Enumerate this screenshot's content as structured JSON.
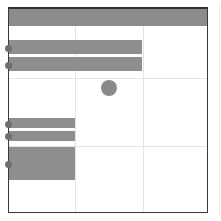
{
  "canvas": {
    "width": 221,
    "height": 221,
    "background": "#ffffff"
  },
  "colors": {
    "frame_border": "#3a3a3a",
    "header_fill": "#8c8c8c",
    "bar_fill": "#8e8e8e",
    "dot_fill": "#6e6e6e",
    "circle_fill": "#8a8a8a",
    "grid_line": "#e4e4e4"
  },
  "frame": {
    "header": {
      "label": ""
    },
    "grid": {
      "columns": 3,
      "rows": 3
    },
    "bars": [
      {
        "id": "bar-1",
        "top": 31,
        "height": 14,
        "width": 133
      },
      {
        "id": "bar-2",
        "top": 48,
        "height": 14,
        "width": 133
      },
      {
        "id": "bar-3",
        "top": 109,
        "height": 10,
        "width": 66
      },
      {
        "id": "bar-4",
        "top": 122,
        "height": 10,
        "width": 66
      },
      {
        "id": "bar-5",
        "top": 138,
        "height": 33,
        "width": 66
      }
    ],
    "dots": [
      {
        "id": "dot-1",
        "y": 39
      },
      {
        "id": "dot-2",
        "y": 56
      },
      {
        "id": "dot-3",
        "y": 115
      },
      {
        "id": "dot-4",
        "y": 127
      },
      {
        "id": "dot-5",
        "y": 155
      }
    ],
    "circle": {
      "cx": 100,
      "cy": 79,
      "r": 8
    }
  }
}
